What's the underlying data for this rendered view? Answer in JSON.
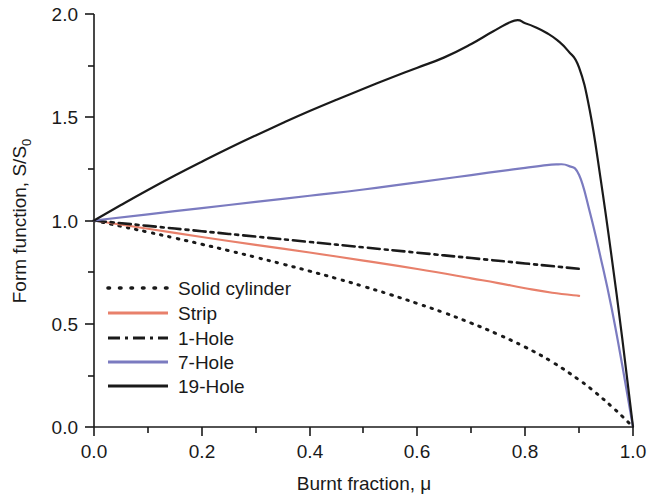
{
  "chart_data": {
    "type": "line",
    "title": "",
    "xlabel": "Burnt fraction, μ",
    "ylabel": "Form function, S/S₀",
    "ylabel_main": "Form function, S/S",
    "ylabel_sub": "0",
    "xlim": [
      0.0,
      1.0
    ],
    "ylim": [
      0.0,
      2.0
    ],
    "grid": false,
    "legend_position": "center-left",
    "xticks": [
      "0.0",
      "0.2",
      "0.4",
      "0.6",
      "0.8",
      "1.0"
    ],
    "xtick_values": [
      0.0,
      0.2,
      0.4,
      0.6,
      0.8,
      1.0
    ],
    "x_minor_ticks": [
      0.1,
      0.3,
      0.5,
      0.7,
      0.9
    ],
    "yticks": [
      "0.0",
      "0.5",
      "1.0",
      "1.5",
      "2.0"
    ],
    "ytick_values": [
      0.0,
      0.5,
      1.0,
      1.5,
      2.0
    ],
    "y_minor_ticks": [
      0.25,
      0.75,
      1.25,
      1.75
    ],
    "series": [
      {
        "name": "Solid cylinder",
        "color": "#1a1a1a",
        "style": "dotted",
        "x": [
          0.0,
          0.05,
          0.1,
          0.15,
          0.2,
          0.25,
          0.3,
          0.35,
          0.4,
          0.45,
          0.5,
          0.55,
          0.6,
          0.65,
          0.7,
          0.75,
          0.8,
          0.85,
          0.9,
          0.93,
          0.96,
          0.98,
          1.0
        ],
        "values": [
          1.0,
          0.972,
          0.944,
          0.915,
          0.885,
          0.854,
          0.822,
          0.789,
          0.755,
          0.719,
          0.681,
          0.641,
          0.598,
          0.553,
          0.503,
          0.448,
          0.387,
          0.315,
          0.228,
          0.168,
          0.1,
          0.052,
          0.0
        ]
      },
      {
        "name": "Strip",
        "color": "#e8806b",
        "style": "solid",
        "x": [
          0.0,
          0.1,
          0.2,
          0.3,
          0.4,
          0.5,
          0.6,
          0.7,
          0.75,
          0.8,
          0.85,
          0.9
        ],
        "values": [
          1.0,
          0.96,
          0.92,
          0.882,
          0.845,
          0.806,
          0.765,
          0.72,
          0.697,
          0.672,
          0.65,
          0.635
        ]
      },
      {
        "name": "1-Hole",
        "color": "#1a1a1a",
        "style": "dashdot",
        "x": [
          0.0,
          0.1,
          0.2,
          0.3,
          0.4,
          0.5,
          0.6,
          0.7,
          0.8,
          0.9
        ],
        "values": [
          1.0,
          0.974,
          0.948,
          0.922,
          0.896,
          0.87,
          0.844,
          0.818,
          0.792,
          0.766
        ]
      },
      {
        "name": "7-Hole",
        "color": "#7b7bc0",
        "style": "solid",
        "x": [
          0.0,
          0.1,
          0.2,
          0.3,
          0.4,
          0.5,
          0.6,
          0.7,
          0.75,
          0.8,
          0.84,
          0.86,
          0.88,
          0.9,
          0.92,
          0.94,
          0.96,
          0.98,
          1.0
        ],
        "values": [
          1.0,
          1.03,
          1.06,
          1.09,
          1.12,
          1.15,
          1.185,
          1.22,
          1.238,
          1.255,
          1.268,
          1.272,
          1.265,
          1.22,
          1.04,
          0.82,
          0.58,
          0.3,
          0.0
        ]
      },
      {
        "name": "19-Hole",
        "color": "#1a1a1a",
        "style": "solid",
        "x": [
          0.0,
          0.05,
          0.1,
          0.15,
          0.2,
          0.25,
          0.3,
          0.35,
          0.4,
          0.45,
          0.5,
          0.55,
          0.6,
          0.65,
          0.7,
          0.74,
          0.78,
          0.8,
          0.82,
          0.84,
          0.86,
          0.88,
          0.9,
          0.92,
          0.94,
          0.96,
          0.98,
          1.0
        ],
        "values": [
          1.0,
          1.075,
          1.148,
          1.218,
          1.285,
          1.35,
          1.412,
          1.472,
          1.53,
          1.585,
          1.638,
          1.69,
          1.74,
          1.79,
          1.855,
          1.915,
          1.968,
          1.955,
          1.935,
          1.908,
          1.872,
          1.82,
          1.74,
          1.53,
          1.2,
          0.83,
          0.43,
          0.0
        ]
      }
    ]
  },
  "legend": {
    "items": [
      {
        "label": "Solid cylinder"
      },
      {
        "label": "Strip"
      },
      {
        "label": "1-Hole"
      },
      {
        "label": "7-Hole"
      },
      {
        "label": "19-Hole"
      }
    ]
  }
}
